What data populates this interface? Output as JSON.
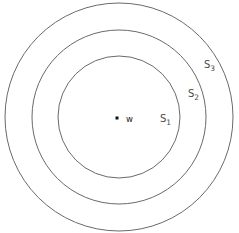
{
  "figure": {
    "background_color": "#ffffff",
    "stroke_color": "#6a6a6a",
    "label_color": "#4a4a4a",
    "point_color": "#111111",
    "width": 239,
    "height": 233
  },
  "center_point": {
    "name": "w",
    "label": "w",
    "x": 117,
    "y": 118,
    "marker": "filled-square-dot",
    "size": 3
  },
  "circles": [
    {
      "id": "S1",
      "base": "S",
      "subscript": "1",
      "label": "S₁",
      "cx": 119,
      "cy": 117,
      "r": 61,
      "label_x": 160,
      "label_y": 122,
      "subscript_dy": 3
    },
    {
      "id": "S2",
      "base": "S",
      "subscript": "2",
      "label": "S₂",
      "cx": 119,
      "cy": 117,
      "r": 87,
      "label_x": 188,
      "label_y": 97,
      "subscript_dy": 3
    },
    {
      "id": "S3",
      "base": "S",
      "subscript": "3",
      "label": "S₃",
      "cx": 119,
      "cy": 117,
      "r": 114,
      "label_x": 204,
      "label_y": 68,
      "subscript_dy": 3
    }
  ]
}
